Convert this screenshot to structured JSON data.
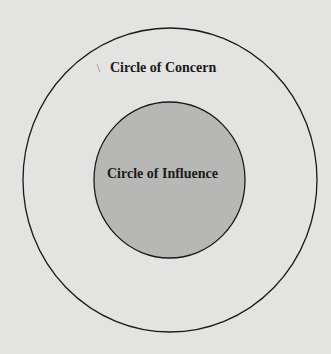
{
  "diagram": {
    "type": "concentric-circles",
    "outer_circle": {
      "label": "Circle of Concern",
      "fill": "#e3e3e1",
      "stroke": "#1a1a1a"
    },
    "inner_circle": {
      "label": "Circle of Influence",
      "fill": "#b7b7b5",
      "stroke": "#1a1a1a"
    }
  }
}
